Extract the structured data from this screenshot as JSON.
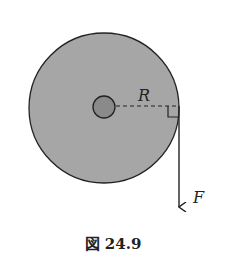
{
  "figure": {
    "radius_label": "R",
    "force_label": "F",
    "caption": "図 24.9"
  },
  "colors": {
    "disk_fill": "#a6a6a6",
    "hub_fill": "#8a8a8a",
    "stroke": "#222222"
  }
}
